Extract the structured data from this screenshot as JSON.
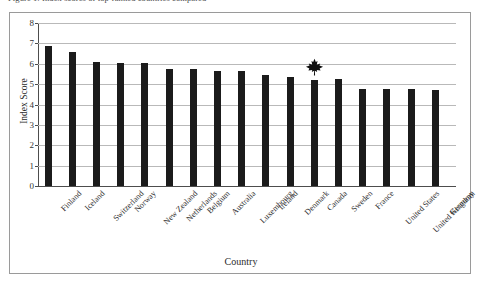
{
  "caption": {
    "text": "Figure 1: Index scores of top-ranked countries compared"
  },
  "chart_data": {
    "type": "bar",
    "title": "",
    "xlabel": "Country",
    "ylabel": "Index Score",
    "ylim": [
      0,
      8
    ],
    "yticks": [
      0,
      1,
      2,
      3,
      4,
      5,
      6,
      7,
      8
    ],
    "grid": true,
    "legend": "none",
    "bar_color": "#1b1b1b",
    "categories": [
      "Finland",
      "Iceland",
      "Switzerland",
      "Norway",
      "New Zealand",
      "Netherlands",
      "Belgium",
      "Australia",
      "Luxembourg",
      "Ireland",
      "Denmark",
      "Canada",
      "Sweden",
      "France",
      "United States",
      "United Kingdom",
      "Germany"
    ],
    "values": [
      6.85,
      6.6,
      6.1,
      6.05,
      6.05,
      5.75,
      5.75,
      5.65,
      5.65,
      5.45,
      5.35,
      5.2,
      5.25,
      4.75,
      4.75,
      4.75,
      4.7
    ],
    "annotations": [
      {
        "icon": "maple-leaf-icon",
        "category": "Canada",
        "description": "Black maple leaf symbol highlighting the Canada bar"
      }
    ]
  }
}
